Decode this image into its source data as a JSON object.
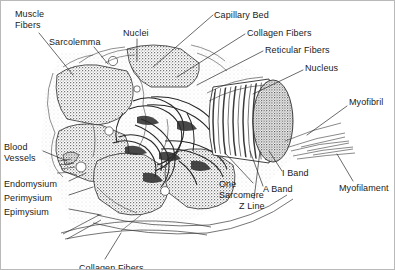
{
  "figure": {
    "style": "black-and-white anatomical line drawing, stippled shading",
    "background_color": "#ffffff",
    "ink_color": "#1a1a1a",
    "border_color": "#b9b9b9"
  },
  "labels": [
    {
      "id": "muscle-fibers",
      "text": "Muscle\nFibers",
      "x": 14,
      "y": 8,
      "align": "left"
    },
    {
      "id": "sarcolemma",
      "text": "Sarcolemma",
      "x": 48,
      "y": 36,
      "align": "left"
    },
    {
      "id": "nuclei",
      "text": "Nuclei",
      "x": 122,
      "y": 27,
      "align": "left"
    },
    {
      "id": "capillary-bed",
      "text": "Capillary Bed",
      "x": 213,
      "y": 9,
      "align": "left"
    },
    {
      "id": "collagen-fibers",
      "text": "Collagen Fibers",
      "x": 246,
      "y": 27,
      "align": "left"
    },
    {
      "id": "reticular-fibers",
      "text": "Reticular Fibers",
      "x": 264,
      "y": 44,
      "align": "left"
    },
    {
      "id": "nucleus",
      "text": "Nucleus",
      "x": 304,
      "y": 62,
      "align": "left"
    },
    {
      "id": "myofibril",
      "text": "Myofibril",
      "x": 348,
      "y": 96,
      "align": "left"
    },
    {
      "id": "myofilament",
      "text": "Myofilament",
      "x": 338,
      "y": 182,
      "align": "left"
    },
    {
      "id": "i-band",
      "text": "I Band",
      "x": 281,
      "y": 167,
      "align": "left"
    },
    {
      "id": "a-band",
      "text": "A Band",
      "x": 262,
      "y": 183,
      "align": "left"
    },
    {
      "id": "z-line",
      "text": "Z Line",
      "x": 238,
      "y": 200,
      "align": "left"
    },
    {
      "id": "one-sarcomere",
      "text": "One\nSarcomere",
      "x": 218,
      "y": 178,
      "align": "left"
    },
    {
      "id": "blood-vessels",
      "text": "Blood\nVessels",
      "x": 3,
      "y": 141,
      "align": "left"
    },
    {
      "id": "endomysium",
      "text": "Endomysium",
      "x": 3,
      "y": 178,
      "align": "left"
    },
    {
      "id": "perimysium",
      "text": "Perimysium",
      "x": 3,
      "y": 192,
      "align": "left"
    },
    {
      "id": "epimysium",
      "text": "Epimysium",
      "x": 3,
      "y": 206,
      "align": "left"
    },
    {
      "id": "collagen-fibers-bottom",
      "text": "Collagen Fibers",
      "x": 78,
      "y": 262,
      "align": "left",
      "clipped": true
    }
  ],
  "leader_lines": [
    {
      "id": "muscle-fibers-leader",
      "points": "38,32 72,74"
    },
    {
      "id": "sarcolemma-leader",
      "points": "93,46 107,63"
    },
    {
      "id": "nuclei-leader",
      "points": "136,38 136,60"
    },
    {
      "id": "capillary-bed-leader",
      "points": "212,14 152,66"
    },
    {
      "id": "collagen-fibers-leader",
      "points": "244,33 176,76"
    },
    {
      "id": "reticular-fibers-leader",
      "points": "262,50 196,84"
    },
    {
      "id": "nucleus-leader",
      "points": "302,69 252,93"
    },
    {
      "id": "myofibril-leader",
      "points": "346,105 306,134"
    },
    {
      "id": "myofilament-leader",
      "points": "352,180 336,153"
    },
    {
      "id": "i-band-leader",
      "points": "281,170 268,150"
    },
    {
      "id": "a-band-leader",
      "points": "262,185 249,150"
    },
    {
      "id": "z-line-leader",
      "points": "253,198 259,150"
    },
    {
      "id": "one-sarcomere-leader",
      "points": "252,182 224,152"
    },
    {
      "id": "blood-vessels-leader",
      "points": "42,150 66,160"
    },
    {
      "id": "endomysium-leader",
      "points": "68,180 85,172"
    },
    {
      "id": "perimysium-leader",
      "points": "68,194 92,186"
    },
    {
      "id": "epimysium-leader",
      "points": "68,208 100,214"
    },
    {
      "id": "collagen-fibers-bottom-leader",
      "points": "104,258 120,232"
    }
  ],
  "structures": [
    {
      "id": "muscle-fiber-cross-section-1",
      "kind": "stippled-polygon"
    },
    {
      "id": "muscle-fiber-cross-section-2",
      "kind": "stippled-polygon"
    },
    {
      "id": "muscle-fiber-cross-section-3",
      "kind": "stippled-polygon"
    },
    {
      "id": "muscle-fiber-cross-section-4",
      "kind": "stippled-polygon"
    },
    {
      "id": "muscle-fiber-cross-section-5",
      "kind": "stippled-polygon"
    },
    {
      "id": "capillary-network",
      "kind": "tubular-mesh"
    },
    {
      "id": "myofibril-cylinder",
      "kind": "striated-cylinder"
    },
    {
      "id": "nucleus-disc",
      "kind": "stippled-ellipse"
    },
    {
      "id": "epimysium-sheet",
      "kind": "tapered-sheet"
    },
    {
      "id": "myofilament-strands",
      "kind": "fine-lines"
    }
  ]
}
